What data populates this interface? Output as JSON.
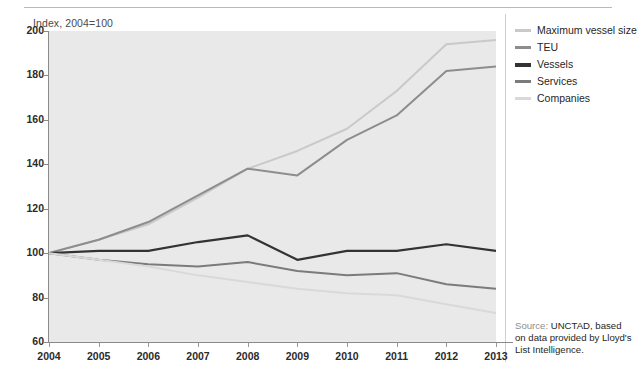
{
  "axis_title": "Index, 2004=100",
  "legend": {
    "items": [
      {
        "label": "Maximum vessel size",
        "color": "#c9c9c9"
      },
      {
        "label": "TEU",
        "color": "#8d8d8d"
      },
      {
        "label": "Vessels",
        "color": "#333333"
      },
      {
        "label": "Services",
        "color": "#7b7b7b"
      },
      {
        "label": "Companies",
        "color": "#d9d9d9"
      }
    ]
  },
  "source": {
    "label": "Source:",
    "text": "UNCTAD, based on data provided by Lloyd's List Intelligence."
  },
  "chart_data": {
    "type": "line",
    "title": "",
    "subtitle": "",
    "xlabel": "",
    "ylabel": "Index, 2004=100",
    "x": [
      "2004",
      "2005",
      "2006",
      "2007",
      "2008",
      "2009",
      "2010",
      "2011",
      "2012",
      "2013"
    ],
    "xlim": [
      2004,
      2013
    ],
    "ylim": [
      60,
      200
    ],
    "yticks": [
      60,
      80,
      100,
      120,
      140,
      160,
      180,
      200
    ],
    "grid": false,
    "legend_position": "right",
    "series": [
      {
        "name": "Maximum vessel size",
        "color": "#c9c9c9",
        "values": [
          100,
          106,
          113,
          125,
          138,
          146,
          156,
          173,
          194,
          196
        ]
      },
      {
        "name": "TEU",
        "color": "#8d8d8d",
        "values": [
          100,
          106,
          114,
          126,
          138,
          135,
          151,
          162,
          182,
          184
        ]
      },
      {
        "name": "Vessels",
        "color": "#333333",
        "values": [
          100,
          101,
          101,
          105,
          108,
          97,
          101,
          101,
          104,
          101
        ]
      },
      {
        "name": "Services",
        "color": "#7b7b7b",
        "values": [
          100,
          97,
          95,
          94,
          96,
          92,
          90,
          91,
          86,
          84
        ]
      },
      {
        "name": "Companies",
        "color": "#d9d9d9",
        "values": [
          100,
          97,
          94,
          90,
          87,
          84,
          82,
          81,
          77,
          73
        ]
      }
    ]
  }
}
